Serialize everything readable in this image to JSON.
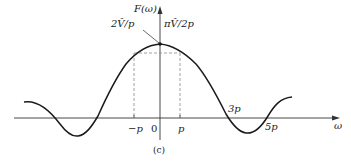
{
  "figure": {
    "y_axis_label": "F(ω)",
    "x_axis_label": "ω",
    "peak_labels": {
      "left": "2V̂/p",
      "right": "πV̂/2p"
    },
    "x_ticks": {
      "neg_p": "−p",
      "zero": "0",
      "p": "p",
      "three_p": "3p",
      "five_p": "5p"
    },
    "caption": "(c)",
    "colors": {
      "curve": "#1a1a1a",
      "axis": "#333333",
      "dashed": "#888888"
    }
  }
}
